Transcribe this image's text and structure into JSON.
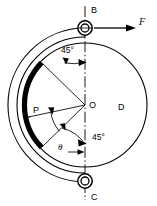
{
  "figure": {
    "background_color": "#ffffff",
    "line_color": "#000000",
    "lining_color": "#000000"
  },
  "labels": {
    "pin_top": "B",
    "pin_bottom": "C",
    "center": "O",
    "drum": "D",
    "lining_point": "P",
    "force": "F",
    "angle_upper": "45°",
    "angle_lower": "45°",
    "angle_theta": "θ"
  },
  "icons": {
    "force_arrow": "arrow-right-icon",
    "pin_top_joint": "pin-joint-icon",
    "pin_bottom_joint": "pin-joint-icon",
    "centerline": "centerline-dash-dot-icon",
    "angle_arc_upper": "angle-arc-icon",
    "angle_arc_lower": "angle-arc-icon",
    "angle_arc_theta": "angle-arc-icon"
  },
  "geometry": {
    "center_x": 85,
    "center_y": 105,
    "drum_radius": 62,
    "band_inner_radius": 68,
    "band_outer_radius": 77,
    "lining_radius": 60,
    "pin_top": {
      "x": 85,
      "y": 28
    },
    "pin_bottom": {
      "x": 85,
      "y": 181
    },
    "centerline_top_y": 6,
    "centerline_bottom_y": 200,
    "force_arrow": {
      "x1": 97,
      "y1": 28,
      "x2": 132,
      "y2": 28
    },
    "upper_radial_angle_deg": 135,
    "lower_radial_angle_deg": 225,
    "p_radial_angle_deg": 192
  }
}
